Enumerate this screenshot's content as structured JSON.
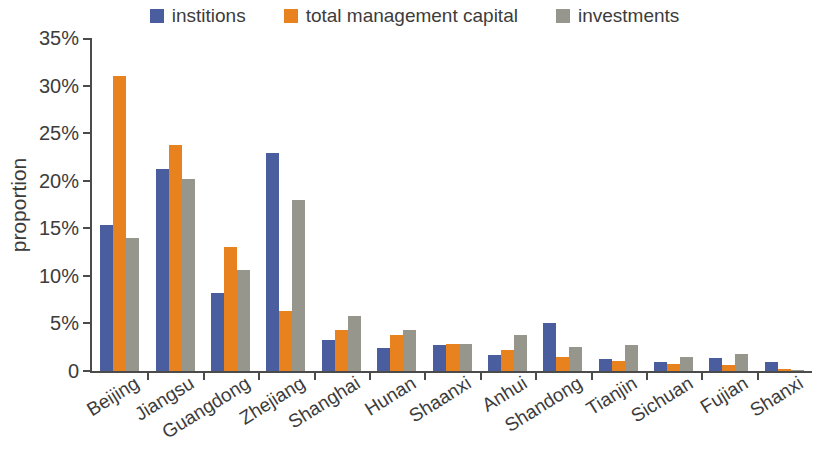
{
  "chart_data": {
    "type": "bar",
    "title": "",
    "xlabel": "",
    "ylabel": "proportion",
    "ylim": [
      0,
      35
    ],
    "grid": false,
    "legend_position": "top-center",
    "ytick_labels": [
      "35%",
      "30%",
      "25%",
      "20%",
      "15%",
      "10%",
      "5%",
      "0"
    ],
    "ytick_values": [
      35,
      30,
      25,
      20,
      15,
      10,
      5,
      0
    ],
    "categories": [
      "Beijing",
      "Jiangsu",
      "Guangdong",
      "Zhejiang",
      "Shanghai",
      "Hunan",
      "Shaanxi",
      "Anhui",
      "Shandong",
      "Tianjin",
      "Sichuan",
      "Fujian",
      "Shanxi"
    ],
    "series": [
      {
        "name": "institions",
        "color": "#4a5d9e",
        "values": [
          15.3,
          21.2,
          8.2,
          22.9,
          3.3,
          2.4,
          2.7,
          1.7,
          5.0,
          1.3,
          0.9,
          1.4,
          1.0
        ]
      },
      {
        "name": "total management capital",
        "color": "#e8821e",
        "values": [
          31.0,
          23.8,
          13.0,
          6.3,
          4.3,
          3.8,
          2.8,
          2.2,
          1.5,
          1.1,
          0.7,
          0.6,
          0.2
        ]
      },
      {
        "name": "investments",
        "color": "#96968c",
        "values": [
          14.0,
          20.2,
          10.6,
          18.0,
          5.8,
          4.3,
          2.8,
          3.8,
          2.5,
          2.7,
          1.5,
          1.8,
          0.1
        ]
      }
    ]
  },
  "legend": {
    "entries": [
      {
        "label": "institions",
        "color": "#4a5d9e"
      },
      {
        "label": "total management capital",
        "color": "#e8821e"
      },
      {
        "label": "investments",
        "color": "#96968c"
      }
    ]
  },
  "axes": {
    "y_title": "proportion"
  }
}
